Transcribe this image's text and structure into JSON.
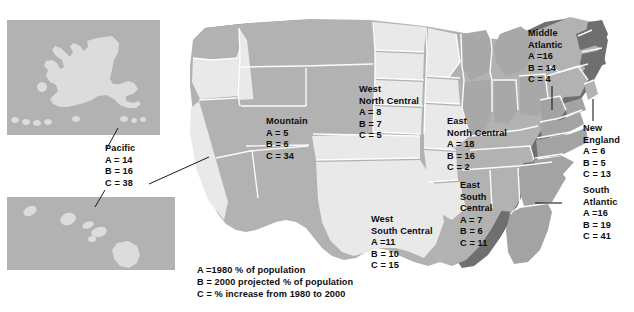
{
  "figure": {
    "insets": [
      {
        "name": "alaska-inset"
      },
      {
        "name": "hawaii-inset"
      }
    ]
  },
  "legend": {
    "lines": [
      "A =1980 % of population",
      "B = 2000 projected % of population",
      "C = % increase from 1980 to 2000"
    ]
  },
  "colors": {
    "light_state": "#e9e9e9",
    "mid_state": "#b2b2b2",
    "dark_shadow": "#6f6f6f",
    "inset_background": "#b2b2b2",
    "inset_land": "#dcdcdc",
    "border": "#ffffff",
    "text": "#0d0d0d"
  },
  "regions": [
    {
      "id": "pacific",
      "name_lines": [
        "Pacific"
      ],
      "a_label": "A = 14",
      "b_label": "B = 16",
      "c_label": "C = 38",
      "a": 14,
      "b": 16,
      "c": 38
    },
    {
      "id": "mountain",
      "name_lines": [
        "Mountain"
      ],
      "a_label": "A = 5",
      "b_label": "B = 6",
      "c_label": "C = 34",
      "a": 5,
      "b": 6,
      "c": 34
    },
    {
      "id": "west-north-central",
      "name_lines": [
        "West",
        "North Central"
      ],
      "a_label": "A = 8",
      "b_label": "B = 7",
      "c_label": "C = 5",
      "a": 8,
      "b": 7,
      "c": 5
    },
    {
      "id": "east-north-central",
      "name_lines": [
        "East",
        "North Central"
      ],
      "a_label": "A = 18",
      "b_label": "B = 16",
      "c_label": "C = 2",
      "a": 18,
      "b": 16,
      "c": 2
    },
    {
      "id": "middle-atlantic",
      "name_lines": [
        "Middle",
        "Atlantic"
      ],
      "a_label": "A =16",
      "b_label": "B = 14",
      "c_label": "C = 4",
      "a": 16,
      "b": 14,
      "c": 4
    },
    {
      "id": "new-england",
      "name_lines": [
        "New",
        "England"
      ],
      "a_label": "A = 6",
      "b_label": "B = 5",
      "c_label": "C = 13",
      "a": 6,
      "b": 5,
      "c": 13
    },
    {
      "id": "south-atlantic",
      "name_lines": [
        "South",
        "Atlantic"
      ],
      "a_label": "A =16",
      "b_label": "B = 19",
      "c_label": "C = 41",
      "a": 16,
      "b": 19,
      "c": 41
    },
    {
      "id": "east-south-central",
      "name_lines": [
        "East",
        "South",
        "Central"
      ],
      "a_label": "A = 7",
      "b_label": "B = 6",
      "c_label": "C = 11",
      "a": 7,
      "b": 6,
      "c": 11
    },
    {
      "id": "west-south-central",
      "name_lines": [
        "West",
        "South Central"
      ],
      "a_label": "A =11",
      "b_label": "B = 10",
      "c_label": "C = 15",
      "a": 11,
      "b": 10,
      "c": 15
    }
  ]
}
